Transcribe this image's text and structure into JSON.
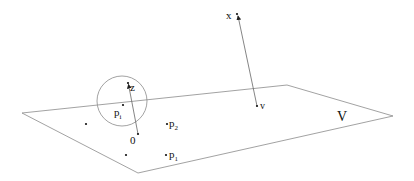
{
  "diagram": {
    "plane": {
      "label": "V",
      "vertices": [
        [
          22,
          113
        ],
        [
          287,
          85
        ],
        [
          393,
          116
        ],
        [
          138,
          173
        ]
      ],
      "stroke": "#8a8a8a"
    },
    "circle": {
      "cx": 122,
      "cy": 101,
      "r": 25,
      "stroke": "#8a8a8a"
    },
    "points": {
      "z": {
        "label": "z",
        "x": 128,
        "y": 83
      },
      "pi": {
        "label": "p",
        "sub": "i",
        "x": 123,
        "y": 105
      },
      "o": {
        "label": "0",
        "x": 138,
        "y": 134
      },
      "p2": {
        "label": "p",
        "sub": "2",
        "x": 167,
        "y": 124
      },
      "p1": {
        "label": "p",
        "sub": "1",
        "x": 166,
        "y": 155
      },
      "x": {
        "label": "x",
        "x": 237,
        "y": 14
      },
      "v": {
        "label": "v",
        "x": 257,
        "y": 106
      },
      "unlabeled": [
        [
          86,
          124
        ],
        [
          126,
          155
        ]
      ]
    },
    "arrows": [
      {
        "from": "o",
        "to": "z"
      },
      {
        "from": "v",
        "to": "x"
      }
    ]
  }
}
